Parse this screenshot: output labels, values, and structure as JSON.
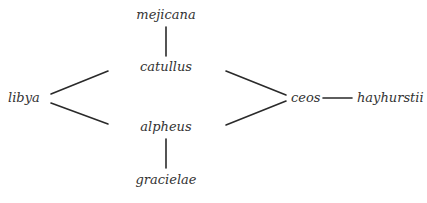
{
  "diagram": {
    "type": "haplotype-network",
    "line_color": "#2a2a2a",
    "text_color": "#333333",
    "nodes": [
      {
        "id": "mejicana",
        "label": "mejicana"
      },
      {
        "id": "catullus",
        "label": "catullus"
      },
      {
        "id": "libya",
        "label": "libya"
      },
      {
        "id": "alpheus",
        "label": "alpheus"
      },
      {
        "id": "gracielae",
        "label": "gracielae"
      },
      {
        "id": "ceos",
        "label": "ceos"
      },
      {
        "id": "hayhurstii",
        "label": "hayhurstii"
      }
    ],
    "edges": [
      {
        "from": "mejicana",
        "to": "catullus"
      },
      {
        "from": "libya",
        "to": "catullus"
      },
      {
        "from": "libya",
        "to": "alpheus"
      },
      {
        "from": "alpheus",
        "to": "gracielae"
      },
      {
        "from": "catullus",
        "to": "ceos"
      },
      {
        "from": "alpheus",
        "to": "ceos"
      },
      {
        "from": "ceos",
        "to": "hayhurstii"
      }
    ]
  }
}
